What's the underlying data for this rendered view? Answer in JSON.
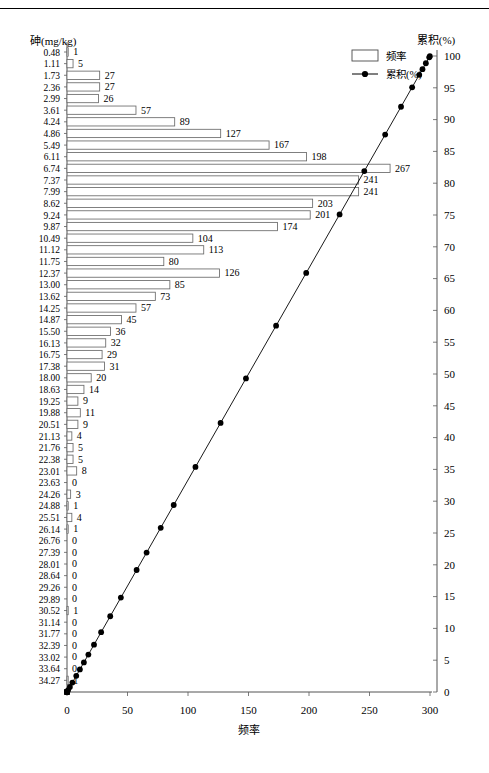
{
  "chart_data": {
    "type": "bar",
    "title": "",
    "subtitle": "",
    "xlabel": "频率",
    "ylabel": "砷(mg/kg)",
    "y2label": "累积(%)",
    "orientation": "horizontal",
    "grid": false,
    "legend_position": "top-right",
    "xlim": [
      0,
      300
    ],
    "xticks": [
      0,
      50,
      100,
      150,
      200,
      250,
      300
    ],
    "xticklabels": [
      "0",
      "50",
      "100",
      "150",
      "200",
      "250",
      "300"
    ],
    "y2lim": [
      0,
      100
    ],
    "y2ticks": [
      0,
      5,
      10,
      15,
      20,
      25,
      30,
      35,
      40,
      45,
      50,
      55,
      60,
      65,
      70,
      75,
      80,
      85,
      90,
      95,
      100
    ],
    "y2ticklabels": [
      "0",
      "5",
      "10",
      "15",
      "20",
      "25",
      "30",
      "35",
      "40",
      "45",
      "50",
      "55",
      "60",
      "65",
      "70",
      "75",
      "80",
      "85",
      "90",
      "95",
      "100"
    ],
    "categories": [
      "0.48",
      "1.11",
      "1.73",
      "2.36",
      "2.99",
      "3.61",
      "4.24",
      "4.86",
      "5.49",
      "6.11",
      "6.74",
      "7.37",
      "7.99",
      "8.62",
      "9.24",
      "9.87",
      "10.49",
      "11.12",
      "11.75",
      "12.37",
      "13.00",
      "13.62",
      "14.25",
      "14.87",
      "15.50",
      "16.13",
      "16.75",
      "17.38",
      "18.00",
      "18.63",
      "19.25",
      "19.88",
      "20.51",
      "21.13",
      "21.76",
      "22.38",
      "23.01",
      "23.63",
      "24.26",
      "24.88",
      "25.51",
      "26.14",
      "26.76",
      "27.39",
      "28.01",
      "28.64",
      "29.26",
      "29.89",
      "30.52",
      "31.14",
      "31.77",
      "32.39",
      "33.02",
      "33.64",
      "34.27"
    ],
    "series": [
      {
        "name": "频率",
        "type": "bar",
        "values": [
          1,
          5,
          27,
          27,
          26,
          57,
          89,
          127,
          167,
          198,
          267,
          241,
          241,
          203,
          201,
          174,
          104,
          113,
          80,
          126,
          85,
          73,
          57,
          45,
          36,
          32,
          29,
          31,
          20,
          14,
          9,
          11,
          9,
          4,
          5,
          5,
          8,
          0,
          3,
          1,
          4,
          1,
          0,
          0,
          0,
          0,
          0,
          0,
          1,
          0,
          0,
          0,
          0,
          0,
          1
        ]
      },
      {
        "name": "累积(%)",
        "type": "line",
        "axis": "right",
        "values": [
          99.96,
          99.79,
          98.86,
          97.93,
          97.04,
          95.08,
          92.02,
          87.65,
          81.9,
          75.09,
          65.9,
          57.6,
          49.3,
          42.31,
          35.39,
          29.4,
          25.82,
          21.93,
          19.18,
          14.84,
          11.91,
          9.4,
          7.44,
          5.89,
          4.65,
          3.55,
          2.55,
          1.48,
          0.79,
          0.31,
          0.0,
          0.0,
          0.0,
          0.0,
          0.0,
          0.0,
          0.0,
          0.0,
          0.0,
          0.0,
          0.0,
          0.0,
          0.0,
          0.0,
          0.0,
          0.0,
          0.0,
          0.0,
          0.0,
          0.0,
          0.0,
          0.0,
          0.0,
          0.0,
          0.0
        ]
      }
    ],
    "legend": [
      {
        "label": "频率",
        "marker": "open-rect"
      },
      {
        "label": "累积(%)",
        "marker": "line-with-dot"
      }
    ]
  },
  "legend": {
    "frequency_label": "频率",
    "cumulative_label": "累积(%)"
  },
  "axes": {
    "y_title": "砷(mg/kg)",
    "x_title": "频率",
    "y2_title": "累积(%)"
  },
  "colors": {
    "line": "#000000",
    "bar_stroke": "#595959",
    "bar_fill": "#ffffff",
    "text": "#000000"
  }
}
